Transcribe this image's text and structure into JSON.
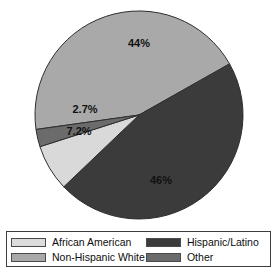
{
  "chart_data": {
    "type": "pie",
    "title": "",
    "subtitle": "",
    "xlabel": "",
    "ylabel": "",
    "grid": false,
    "legend_position": "bottom",
    "categories": [
      "African American",
      "Non-Hispanic White",
      "Hispanic/Latino",
      "Other"
    ],
    "values": [
      7.2,
      44,
      46,
      2.7
    ],
    "value_unit": "%",
    "data_labels": [
      "7.2%",
      "44%",
      "46%",
      "2.7%"
    ],
    "slice_colors": [
      "#d9d9d9",
      "#a9a9a9",
      "#3b3b3b",
      "#6b6b6b"
    ],
    "slices": [
      {
        "label": "Non-Hispanic White",
        "value": 44,
        "data_label": "44%",
        "color": "#a9a9a9",
        "label_x": 139,
        "label_y": 44
      },
      {
        "label": "Hispanic/Latino",
        "value": 46,
        "data_label": "46%",
        "color": "#3b3b3b",
        "label_x": 161,
        "label_y": 181
      },
      {
        "label": "African American",
        "value": 7.2,
        "data_label": "7.2%",
        "color": "#d9d9d9",
        "label_x": 79,
        "label_y": 132
      },
      {
        "label": "Other",
        "value": 2.7,
        "data_label": "2.7%",
        "color": "#6b6b6b",
        "label_x": 85,
        "label_y": 110
      }
    ],
    "geometry": {
      "center_x": 139,
      "center_y": 115,
      "radius": 104,
      "start_angle_deg": 172
    }
  },
  "legend": {
    "rows": [
      {
        "left": {
          "label": "African American",
          "color": "#dcdcdc"
        },
        "right": {
          "label": "Hispanic/Latino",
          "color": "#3b3b3b"
        }
      },
      {
        "left": {
          "label": "Non-Hispanic White",
          "color": "#a9a9a9"
        },
        "right": {
          "label": "Other",
          "color": "#6b6b6b"
        }
      }
    ]
  }
}
